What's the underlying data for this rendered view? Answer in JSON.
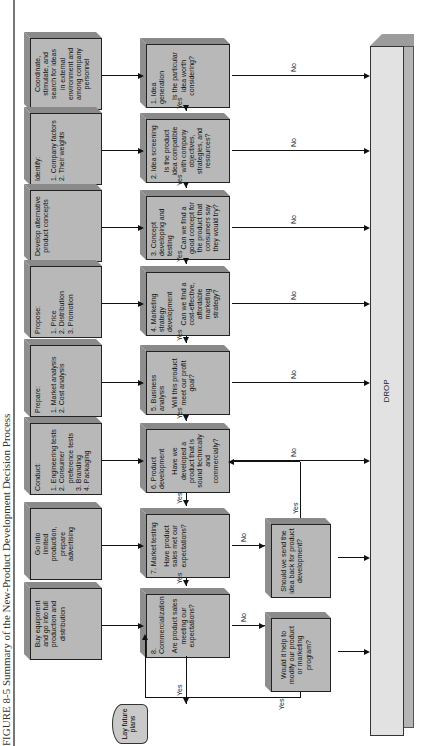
{
  "title": {
    "text": "FIGURE 8-5  Summary of the New-Product Development Decision Process"
  },
  "instructions": [
    {
      "id": "coordinate",
      "lines": [
        "Coordinate,",
        "stimulate, and",
        "search for ideas",
        "in external",
        "environment and",
        "among company",
        "personnel"
      ]
    },
    {
      "id": "identify",
      "lines": [
        "Identify:",
        "",
        "1. Company factors",
        "2. Their weights"
      ]
    },
    {
      "id": "develop",
      "lines": [
        "Develop alternative",
        "product concepts"
      ]
    },
    {
      "id": "propose",
      "lines": [
        "Propose:",
        "",
        "1. Price",
        "2. Distribution",
        "3. Promotion"
      ]
    },
    {
      "id": "prepare",
      "lines": [
        "Prepare:",
        "",
        "1. Market analysis",
        "2. Cost analysis"
      ]
    },
    {
      "id": "conduct",
      "lines": [
        "Conduct:",
        "",
        "1. Engineering tests",
        "2. Consumer",
        "    preference tests",
        "3. Branding",
        "4. Packaging"
      ]
    },
    {
      "id": "limited",
      "lines": [
        "Go into",
        "limited",
        "production,",
        "prepare",
        "advertising"
      ]
    },
    {
      "id": "full",
      "lines": [
        "Buy equipment",
        "and go into full",
        "production and",
        "distribution"
      ]
    }
  ],
  "steps": [
    {
      "head": "1. Idea generation",
      "question": "Is the particular idea worth considering?"
    },
    {
      "head": "2. Idea screening",
      "question": "Is the product idea compatible with company objectives, strategies, and resources?"
    },
    {
      "head": "3. Concept developing and testing",
      "question": "Can we find a good concept for the product that consumers say they would try?"
    },
    {
      "head": "4. Marketing strategy development",
      "question": "Can we find a cost-effective, affordable marketing strategy?"
    },
    {
      "head": "5. Business analysis",
      "question": "Will this product meet our profit goal?"
    },
    {
      "head": "6. Product development",
      "question": "Have we developed a product that is sound technically and commercially?"
    },
    {
      "head": "7. Market testing",
      "question": "Have product sales met our expectations?"
    },
    {
      "head": "8. Commercialization",
      "question": "Are product sales meeting our expectations?"
    }
  ],
  "decisions": [
    {
      "id": "send-back",
      "text": "Should we send the idea back for product development?"
    },
    {
      "id": "modify",
      "text": "Would it help to modify our product or marketing program?"
    }
  ],
  "terminal": {
    "text": "Lay future plans"
  },
  "drop": {
    "label": "DROP"
  },
  "labels": {
    "yes": "Yes",
    "no": "No"
  },
  "colors": {
    "box_face": "#b8b8b8",
    "box_top": "#8e8e8e",
    "drop_face": "#e2e2e2",
    "line": "#111111"
  }
}
